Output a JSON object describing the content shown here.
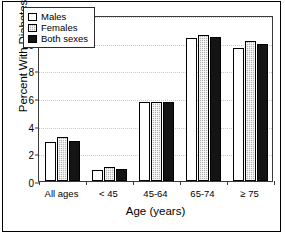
{
  "figure": {
    "has_outer_border": true,
    "border_color": "#000000",
    "background": "#ffffff"
  },
  "chart_data": {
    "type": "bar",
    "title": "",
    "subtitle": "",
    "xlabel": "Age (years)",
    "ylabel": "Percent With Diabetes",
    "categories": [
      "All ages",
      "< 45",
      "45-64",
      "65-74",
      "≥ 75"
    ],
    "series": [
      {
        "name": "Males",
        "color": "#ffffff",
        "pattern": "solid-white",
        "values": [
          2.8,
          0.8,
          5.7,
          10.35,
          9.6
        ]
      },
      {
        "name": "Females",
        "color": "#b4b4b4",
        "pattern": "gray-stipple",
        "values": [
          3.2,
          1.0,
          5.7,
          10.55,
          10.1
        ]
      },
      {
        "name": "Both sexes",
        "color": "#141414",
        "pattern": "solid-black",
        "values": [
          2.9,
          0.85,
          5.7,
          10.4,
          9.9
        ]
      }
    ],
    "ylim": [
      0,
      12
    ],
    "yticks": [
      0,
      2,
      4,
      6,
      8,
      10,
      12
    ],
    "ytick_labels": [
      "0",
      "2",
      "4",
      "6",
      "8",
      "10",
      "12"
    ],
    "grid": true,
    "grid_style": "dotted",
    "grid_color": "#c9c9c9",
    "legend_position": "upper-left-inside",
    "bar_edge_color": "#000000"
  },
  "legend": {
    "entries": [
      {
        "label": "Males"
      },
      {
        "label": "Females"
      },
      {
        "label": "Both sexes"
      }
    ]
  }
}
